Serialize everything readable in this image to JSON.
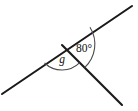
{
  "figure": {
    "background_color": "#ffffff",
    "line_color": "#1a1a1a",
    "arc_color": "#4a4a4a",
    "label_color": "#111111"
  },
  "geometry": {
    "vertex": {
      "x": 62,
      "y": 45
    },
    "rays": [
      {
        "name": "ray-lower-left",
        "from": {
          "x": 62,
          "y": 45
        },
        "to": {
          "x": 2,
          "y": 94
        }
      },
      {
        "name": "ray-upper-right",
        "from": {
          "x": 62,
          "y": 45
        },
        "to": {
          "x": 132,
          "y": 6
        }
      },
      {
        "name": "ray-lower-right",
        "from": {
          "x": 62,
          "y": 45
        },
        "to": {
          "x": 122,
          "y": 105
        }
      }
    ],
    "arcs": [
      {
        "name": "arc-angle-g",
        "radius": 25,
        "start": {
          "x": 44.6,
          "y": 63.0
        },
        "end": {
          "x": 79.7,
          "y": 62.7
        },
        "sweep": 0
      },
      {
        "name": "arc-angle-80",
        "radius": 32,
        "start": {
          "x": 90.0,
          "y": 27.2
        },
        "end": {
          "x": 84.6,
          "y": 67.6
        },
        "sweep": 1
      }
    ]
  },
  "labels": {
    "known_angle": {
      "text": "80°",
      "value": 80,
      "unit": "degrees",
      "x": 84,
      "y": 49
    },
    "unknown_angle": {
      "text": "g",
      "x": 62,
      "y": 60
    }
  }
}
